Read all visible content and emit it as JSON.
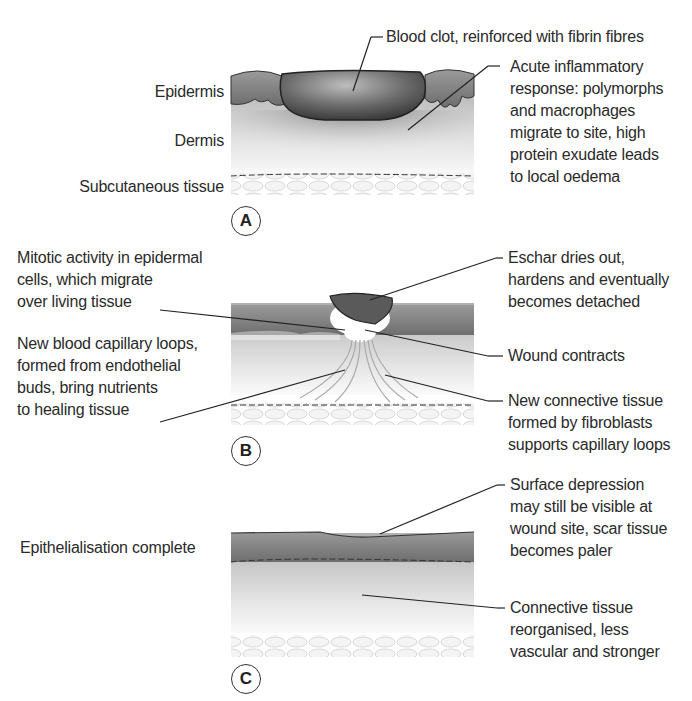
{
  "panels": [
    {
      "id": "A",
      "badge": "A",
      "left_labels": [
        "Epidermis",
        "Dermis",
        "Subcutaneous tissue"
      ],
      "annotations": [
        "Blood clot, reinforced with fibrin fibres",
        [
          "Acute inflammatory",
          "response: polymorphs",
          "and macrophages",
          "migrate to site, high",
          "protein exudate leads",
          "to local oedema"
        ]
      ]
    },
    {
      "id": "B",
      "badge": "B",
      "left_annotations": [
        [
          "Mitotic activity in epidermal",
          "cells, which migrate",
          "over living tissue"
        ],
        [
          "New blood capillary loops,",
          "formed from endothelial",
          "buds, bring nutrients",
          "to healing tissue"
        ]
      ],
      "right_annotations": [
        [
          "Eschar dries out,",
          "hardens and eventually",
          "becomes detached"
        ],
        "Wound contracts",
        [
          "New connective tissue",
          "formed by fibroblasts",
          "supports capillary loops"
        ]
      ]
    },
    {
      "id": "C",
      "badge": "C",
      "left_labels": [
        "Epithelialisation complete"
      ],
      "annotations": [
        [
          "Surface depression",
          "may still be visible at",
          "wound site, scar tissue",
          "becomes paler"
        ],
        [
          "Connective tissue",
          "reorganised, less",
          "vascular and stronger"
        ]
      ]
    }
  ],
  "colors": {
    "text": "#2a2a2a",
    "line": "#222222",
    "clot": "#555555",
    "epidermis": "#8a8a8a"
  }
}
